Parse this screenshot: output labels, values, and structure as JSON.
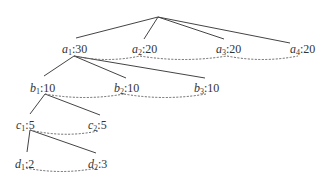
{
  "diagram": {
    "type": "tree",
    "root": {
      "x": 158,
      "y": 17
    },
    "nodes": [
      {
        "id": "a1",
        "var": "a",
        "sub": "1",
        "value": "30",
        "x": 62,
        "y": 43,
        "anchor_top": {
          "x": 76,
          "y": 38
        },
        "anchor_bottom": {
          "x": 74,
          "y": 56
        }
      },
      {
        "id": "a2",
        "var": "a",
        "sub": "2",
        "value": "20",
        "x": 132,
        "y": 43,
        "anchor_top": {
          "x": 144,
          "y": 39
        },
        "anchor_bottom": {
          "x": 140,
          "y": 56
        }
      },
      {
        "id": "a3",
        "var": "a",
        "sub": "3",
        "value": "20",
        "x": 216,
        "y": 43,
        "anchor_top": {
          "x": 224,
          "y": 39
        },
        "anchor_bottom": {
          "x": 227,
          "y": 56
        }
      },
      {
        "id": "a4",
        "var": "a",
        "sub": "4",
        "value": "20",
        "x": 290,
        "y": 43,
        "anchor_top": {
          "x": 290,
          "y": 43
        },
        "anchor_bottom": {
          "x": 298,
          "y": 56
        }
      },
      {
        "id": "b1",
        "var": "b",
        "sub": "1",
        "value": "10",
        "x": 30,
        "y": 82,
        "anchor_top": {
          "x": 44,
          "y": 76
        },
        "anchor_bottom": {
          "x": 45,
          "y": 94
        }
      },
      {
        "id": "b2",
        "var": "b",
        "sub": "2",
        "value": "10",
        "x": 114,
        "y": 82,
        "anchor_top": {
          "x": 126,
          "y": 78
        },
        "anchor_bottom": {
          "x": 124,
          "y": 94
        }
      },
      {
        "id": "b3",
        "var": "b",
        "sub": "3",
        "value": "10",
        "x": 194,
        "y": 82,
        "anchor_top": {
          "x": 205,
          "y": 78
        },
        "anchor_bottom": {
          "x": 206,
          "y": 94
        }
      },
      {
        "id": "c1",
        "var": "c",
        "sub": "1",
        "value": "5",
        "x": 16,
        "y": 119,
        "anchor_top": {
          "x": 30,
          "y": 114
        },
        "anchor_bottom": {
          "x": 30,
          "y": 130
        }
      },
      {
        "id": "c2",
        "var": "c",
        "sub": "2",
        "value": "5",
        "x": 88,
        "y": 119,
        "anchor_top": {
          "x": 100,
          "y": 115
        },
        "anchor_bottom": {
          "x": 98,
          "y": 131
        }
      },
      {
        "id": "d1",
        "var": "d",
        "sub": "1",
        "value": "2",
        "x": 15,
        "y": 158,
        "anchor_top": {
          "x": 27,
          "y": 152
        },
        "anchor_bottom": {
          "x": 26,
          "y": 168
        }
      },
      {
        "id": "d2",
        "var": "d",
        "sub": "2",
        "value": "3",
        "x": 88,
        "y": 158,
        "anchor_top": {
          "x": 96,
          "y": 153
        },
        "anchor_bottom": {
          "x": 97,
          "y": 168
        }
      }
    ],
    "edges": [
      {
        "from": "root",
        "to": "a1"
      },
      {
        "from": "root",
        "to": "a2"
      },
      {
        "from": "root",
        "to": "a3"
      },
      {
        "from": "root",
        "to": "a4"
      },
      {
        "from": "a1",
        "to": "b1"
      },
      {
        "from": "a1",
        "to": "b2"
      },
      {
        "from": "a1",
        "to": "b3"
      },
      {
        "from": "b1",
        "to": "c1"
      },
      {
        "from": "b1",
        "to": "c2"
      },
      {
        "from": "c1",
        "to": "d1"
      },
      {
        "from": "c1",
        "to": "d2"
      }
    ],
    "sibling_links": [
      {
        "from": "a1",
        "to": "a2"
      },
      {
        "from": "a2",
        "to": "a3"
      },
      {
        "from": "a3",
        "to": "a4"
      },
      {
        "from": "b1",
        "to": "b2"
      },
      {
        "from": "b2",
        "to": "b3"
      },
      {
        "from": "c1",
        "to": "c2"
      },
      {
        "from": "d1",
        "to": "d2"
      }
    ],
    "colors": {
      "edge": "#444444",
      "sibling_link": "#666666",
      "text": "#333333"
    }
  }
}
